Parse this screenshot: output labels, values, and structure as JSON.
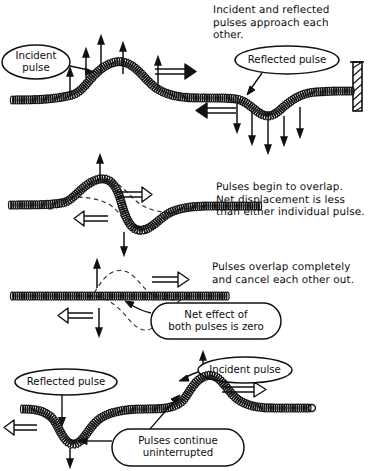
{
  "figure": {
    "ink_color": "#111111",
    "background_color": "#ffffff",
    "dashed_color": "#333333"
  },
  "panels": [
    {
      "id": "panel-1",
      "caption": "Incident and reflected\npulses approach each\nother.",
      "labels": [
        {
          "name": "incident-pulse",
          "text": "Incident\npulse"
        },
        {
          "name": "reflected-pulse",
          "text": "Reflected pulse"
        }
      ],
      "features": [
        "rope",
        "crest-left",
        "trough-right",
        "wall",
        "up-arrows",
        "down-arrows",
        "right-velocity-arrow",
        "left-velocity-arrow"
      ]
    },
    {
      "id": "panel-2",
      "caption": "Pulses begin to overlap.\nNet displacement is less\nthan either individual pulse.",
      "labels": [],
      "features": [
        "rope",
        "s-curve",
        "dashed-ghost-crest",
        "dashed-ghost-trough",
        "up-arrow",
        "down-arrow",
        "right-velocity-arrow",
        "left-velocity-arrow"
      ]
    },
    {
      "id": "panel-3",
      "caption": "Pulses overlap completely\nand cancel each other out.",
      "labels": [
        {
          "name": "net-effect",
          "text": "Net effect of\nboth pulses is zero"
        }
      ],
      "features": [
        "rope-flat",
        "dashed-ghost-crest",
        "dashed-ghost-trough",
        "up-arrow",
        "down-arrow",
        "right-velocity-arrow",
        "left-velocity-arrow"
      ]
    },
    {
      "id": "panel-4",
      "caption": "",
      "labels": [
        {
          "name": "reflected-pulse",
          "text": "Reflected pulse"
        },
        {
          "name": "incident-pulse",
          "text": "Incident pulse"
        },
        {
          "name": "pulses-continue",
          "text": "Pulses continue\nuninterrupted"
        }
      ],
      "features": [
        "rope",
        "trough-left",
        "crest-right",
        "up-arrow",
        "down-arrow",
        "right-velocity-arrow",
        "left-velocity-arrow"
      ]
    }
  ]
}
